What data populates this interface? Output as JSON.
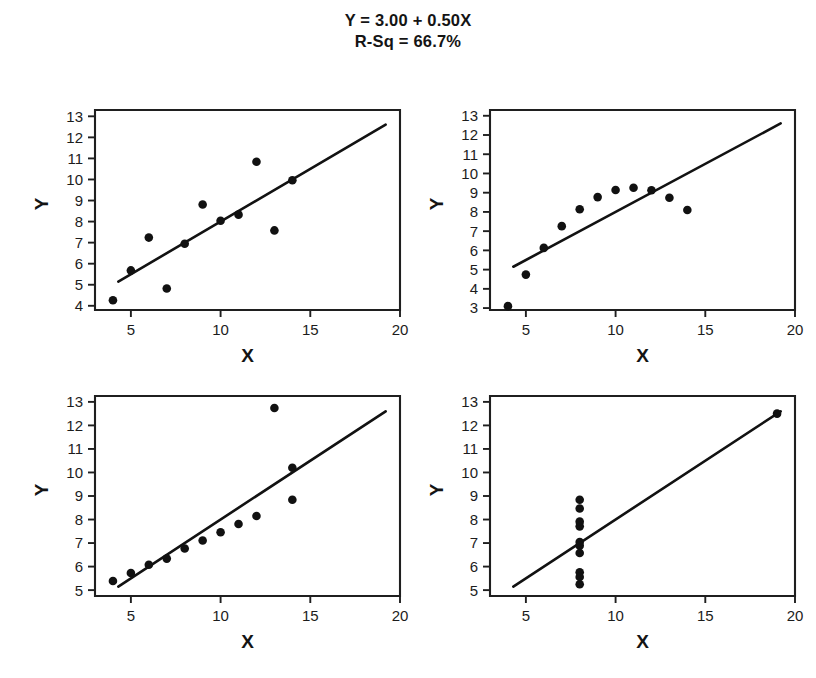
{
  "title": {
    "equation": "Y = 3.00 + 0.50X",
    "r_squared": "R-Sq = 66.7%"
  },
  "axis_titles": {
    "x": "X",
    "y": "Y"
  },
  "chart_data": [
    {
      "type": "scatter",
      "title": "",
      "panel": "top-left",
      "xlabel": "X",
      "ylabel": "Y",
      "xlim": [
        3,
        20
      ],
      "ylim": [
        3.8,
        13.3
      ],
      "xticks": [
        5,
        10,
        15,
        20
      ],
      "yticks": [
        4,
        5,
        6,
        7,
        8,
        9,
        10,
        11,
        12,
        13
      ],
      "grid": false,
      "legend": "none",
      "x": [
        4,
        5,
        6,
        7,
        8,
        9,
        10,
        11,
        12,
        13,
        14
      ],
      "y": [
        4.26,
        5.68,
        7.24,
        4.82,
        6.95,
        8.81,
        8.04,
        8.33,
        10.84,
        7.58,
        9.96
      ],
      "fit_line": {
        "intercept": 3.0,
        "slope": 0.5,
        "x_start": 4.3,
        "x_end": 19.2
      }
    },
    {
      "type": "scatter",
      "title": "",
      "panel": "top-right",
      "xlabel": "X",
      "ylabel": "Y",
      "xlim": [
        3,
        20
      ],
      "ylim": [
        2.9,
        13.3
      ],
      "xticks": [
        5,
        10,
        15,
        20
      ],
      "yticks": [
        3,
        4,
        5,
        6,
        7,
        8,
        9,
        10,
        11,
        12,
        13
      ],
      "grid": false,
      "legend": "none",
      "x": [
        4,
        5,
        6,
        7,
        8,
        9,
        10,
        11,
        12,
        13,
        14
      ],
      "y": [
        3.1,
        4.74,
        6.13,
        7.26,
        8.14,
        8.77,
        9.14,
        9.26,
        9.13,
        8.74,
        8.1
      ],
      "fit_line": {
        "intercept": 3.0,
        "slope": 0.5,
        "x_start": 4.3,
        "x_end": 19.2
      }
    },
    {
      "type": "scatter",
      "title": "",
      "panel": "bottom-left",
      "xlabel": "X",
      "ylabel": "Y",
      "xlim": [
        3,
        20
      ],
      "ylim": [
        4.75,
        13.25
      ],
      "xticks": [
        5,
        10,
        15,
        20
      ],
      "yticks": [
        5,
        6,
        7,
        8,
        9,
        10,
        11,
        12,
        13
      ],
      "grid": false,
      "legend": "none",
      "x": [
        4,
        5,
        6,
        7,
        8,
        9,
        10,
        11,
        12,
        13,
        14
      ],
      "y": [
        5.39,
        5.73,
        6.08,
        6.34,
        6.77,
        7.11,
        7.46,
        7.81,
        8.15,
        12.74,
        8.84
      ],
      "extra_points": [
        {
          "x": 14,
          "y": 10.2
        }
      ],
      "fit_line": {
        "intercept": 3.0,
        "slope": 0.5,
        "x_start": 4.3,
        "x_end": 19.2
      }
    },
    {
      "type": "scatter",
      "title": "",
      "panel": "bottom-right",
      "xlabel": "X",
      "ylabel": "Y",
      "xlim": [
        3,
        20
      ],
      "ylim": [
        4.75,
        13.25
      ],
      "xticks": [
        5,
        10,
        15,
        20
      ],
      "yticks": [
        5,
        6,
        7,
        8,
        9,
        10,
        11,
        12,
        13
      ],
      "grid": false,
      "legend": "none",
      "x": [
        8,
        8,
        8,
        8,
        8,
        8,
        8,
        8,
        8,
        8,
        19
      ],
      "y": [
        6.58,
        5.76,
        7.71,
        8.84,
        8.47,
        7.04,
        5.25,
        5.56,
        7.91,
        6.89,
        12.5
      ],
      "fit_line": {
        "intercept": 3.0,
        "slope": 0.5,
        "x_start": 4.3,
        "x_end": 19.2
      }
    }
  ],
  "colors": {
    "ink": "#111111",
    "background": "#ffffff"
  }
}
